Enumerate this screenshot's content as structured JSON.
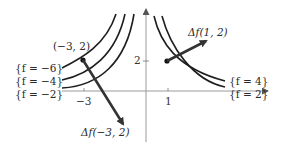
{
  "diagram": {
    "type": "level-curves-with-gradient-vectors",
    "axes": {
      "x_tick_labels": [
        "−3",
        "1"
      ],
      "y_tick_labels": [
        "2"
      ]
    },
    "points": [
      {
        "label": "(−3, 2)"
      }
    ],
    "gradient_labels": {
      "left": "Δf(−3, 2)",
      "right": "Δf(1, 2)"
    },
    "level_curves": {
      "left": [
        "{f = −6}",
        "{f = −4}",
        "{f = −2}"
      ],
      "right": [
        "{f = 4}",
        "{f = 2}"
      ]
    },
    "colors": {
      "curve": "#1e1e1e",
      "axis": "#9a9a9a",
      "arrow": "#333333"
    }
  }
}
